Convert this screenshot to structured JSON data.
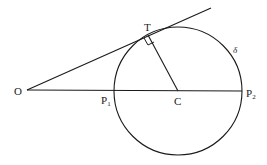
{
  "diagram": {
    "labels": {
      "O": "O",
      "T": "T",
      "C": "C",
      "P1": "P",
      "P1_sub": "1",
      "P2": "P",
      "P2_sub": "2",
      "circle": "δ"
    },
    "points": {
      "O": [
        27,
        90
      ],
      "T": [
        148,
        35
      ],
      "C": [
        178,
        91
      ],
      "P1": [
        114,
        91
      ],
      "P2": [
        242,
        91
      ],
      "tangent_end": [
        211,
        8
      ]
    },
    "circle": {
      "cx": 178,
      "cy": 91,
      "r": 64
    },
    "colors": {
      "stroke": "#1a1a1a",
      "background": "#ffffff"
    }
  }
}
